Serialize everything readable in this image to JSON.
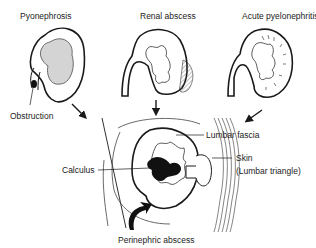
{
  "diagram": {
    "top_panels": [
      {
        "title": "Pyonephrosis",
        "callout": "Obstruction"
      },
      {
        "title": "Renal abscess"
      },
      {
        "title": "Acute pyelonephritis"
      }
    ],
    "bottom_panel": {
      "title": "Perinephric abscess",
      "callouts": {
        "left": "Calculus",
        "right_top": "Lumbar fascia",
        "right_mid_line1": "Skin",
        "right_mid_line2": "(Lumbar triangle)"
      }
    },
    "colors": {
      "line": "#1a1a1a",
      "shade": "#d4d4d4",
      "stone": "#111111"
    }
  }
}
